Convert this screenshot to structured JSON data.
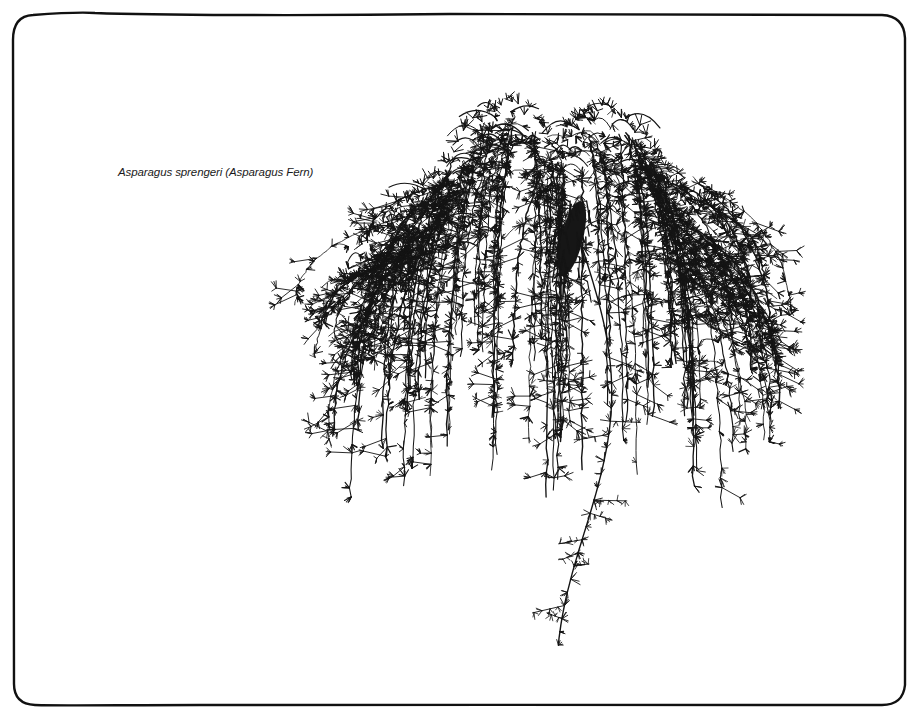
{
  "illustration": {
    "caption": "Asparagus sprengeri (Asparagus Fern)",
    "subject": "asparagus-fern-hanging-plant",
    "style": "pen-and-ink botanical line drawing",
    "ink_color": "#141414",
    "paper_color": "#ffffff"
  },
  "frame": {
    "x": 13,
    "y": 15,
    "width": 893,
    "height": 690,
    "corner_radius": 20,
    "stroke_width": 2.4,
    "stroke_color": "#111111"
  },
  "plant": {
    "crown_center_x": 555,
    "crown_top_y": 96,
    "crown_left_x": 318,
    "crown_right_x": 782,
    "crown_bottom_y": 470,
    "pot_mass": {
      "x": 572,
      "y": 238,
      "rx": 11,
      "ry": 38
    },
    "long_tendril_tip": {
      "x": 603,
      "y": 645
    },
    "strand_count": 70,
    "seed": 7
  }
}
